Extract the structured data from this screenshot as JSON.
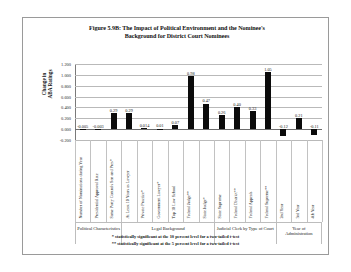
{
  "figure": {
    "title": "Figure 5.9B: The Impact of Political Environment and the Nominee's Background for District Court Nominees",
    "title_line1": "Figure 5.9B: The Impact of Political Environment and the Nominee's",
    "title_line2": "Background for District Court Nominees",
    "footnote1": "* statistically significant at the 10 percent level for a two-tailed t-test",
    "footnote2": "** statistically significant at the 5 percent level for a two-tailed t-test"
  },
  "axis": {
    "y_title_line1": "Change in",
    "y_title_line2": "ABA Ratings",
    "y_title": "Change in ABA Ratings",
    "y_ticks": [
      "1.200",
      "1.000",
      "0.800",
      "0.600",
      "0.400",
      "0.200",
      "0.000",
      "-0.200"
    ]
  },
  "groups": [
    {
      "label": "Political Characteristics",
      "label_line1": "Political Characteristics",
      "label_line2": "",
      "count": 3
    },
    {
      "label": "Legal Background",
      "label_line1": "Legal Background",
      "label_line2": "",
      "count": 6
    },
    {
      "label": "Judicial Clerk by Type of Court",
      "label_line1": "Judicial Clerk by Type of Court",
      "label_line2": "",
      "count": 4
    },
    {
      "label": "Year of Administration",
      "label_line1": "Year of",
      "label_line2": "Administration",
      "count": 3
    }
  ],
  "chart_data": {
    "type": "bar",
    "title": "Figure 5.9B: The Impact of Political Environment and the Nominee's Background for District Court Nominees",
    "xlabel": "",
    "ylabel": "Change in ABA Ratings",
    "ylim": [
      -0.2,
      1.2
    ],
    "ytick_step": 0.2,
    "grid": true,
    "legend": "none",
    "bar_color": "#0b0b0b",
    "categories": [
      "Number of Nominations during Year",
      "Presidential Approval Rate",
      "Same Party Controls Sen and Pres*",
      "At Least 10 Years as Lawyer",
      "Private Practice*",
      "Government Lawyer*",
      "Top 10 Law School",
      "Federal Judge**",
      "State Judge*",
      "State Supreme",
      "Federal District**",
      "Federal Appeals",
      "Federal Supreme**",
      "2nd Year",
      "3rd Year",
      "4th Year"
    ],
    "values": [
      -0.005,
      -0.003,
      0.29,
      0.29,
      0.014,
      0.01,
      0.07,
      0.98,
      0.47,
      0.26,
      0.4,
      0.33,
      1.05,
      -0.12,
      0.21,
      -0.11
    ],
    "value_labels": [
      "-0.005",
      "-0.003",
      "0.29",
      "0.29",
      "0.014",
      "0.01",
      "0.07",
      "0.98",
      "0.47",
      "0.26",
      "0.40",
      "0.33",
      "1.05",
      "-0.12",
      "0.21",
      "-0.11"
    ],
    "group_of": [
      0,
      0,
      0,
      1,
      1,
      1,
      1,
      1,
      1,
      2,
      2,
      2,
      2,
      3,
      3,
      3
    ]
  }
}
